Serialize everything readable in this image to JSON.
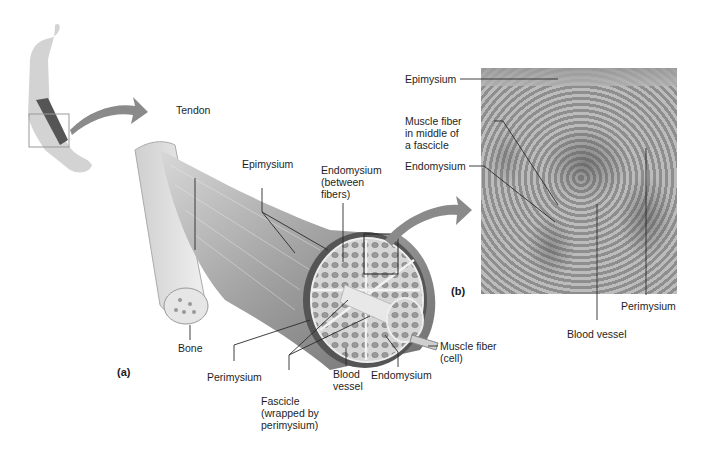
{
  "figure": {
    "panels": {
      "a": "(a)",
      "b": "(b)"
    },
    "panel_a_labels": {
      "tendon": "Tendon",
      "epimysium": "Epimysium",
      "endomysium_between": "Endomysium\n(between\nfibers)",
      "bone": "Bone",
      "perimysium": "Perimysium",
      "fascicle": "Fascicle\n(wrapped by\nperimysium)",
      "blood_vessel": "Blood\nvessel",
      "endomysium": "Endomysium",
      "muscle_fiber": "Muscle fiber\n(cell)"
    },
    "panel_b_labels": {
      "epimysium": "Epimysium",
      "muscle_fiber_middle": "Muscle fiber\nin middle of\na fascicle",
      "endomysium": "Endomysium",
      "perimysium": "Perimysium",
      "blood_vessel": "Blood vessel"
    },
    "colors": {
      "arrow": "#8a8a8a",
      "muscle": "#9c9c9c",
      "line": "#2a2a2a",
      "photo": "#a6a6a6"
    }
  }
}
